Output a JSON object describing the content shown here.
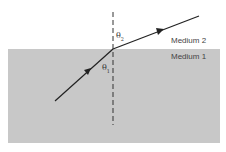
{
  "diagram": {
    "media": [
      {
        "name": "medium-2",
        "label": "Medium 2",
        "color": "#ffffff"
      },
      {
        "name": "medium-1",
        "label": "Medium 1",
        "color": "#c8c8c8"
      }
    ],
    "angles": [
      {
        "symbol": "θ",
        "subscript": "2"
      },
      {
        "symbol": "θ",
        "subscript": "1"
      }
    ],
    "normal_line": "dashed",
    "ray_color": "#222222"
  }
}
